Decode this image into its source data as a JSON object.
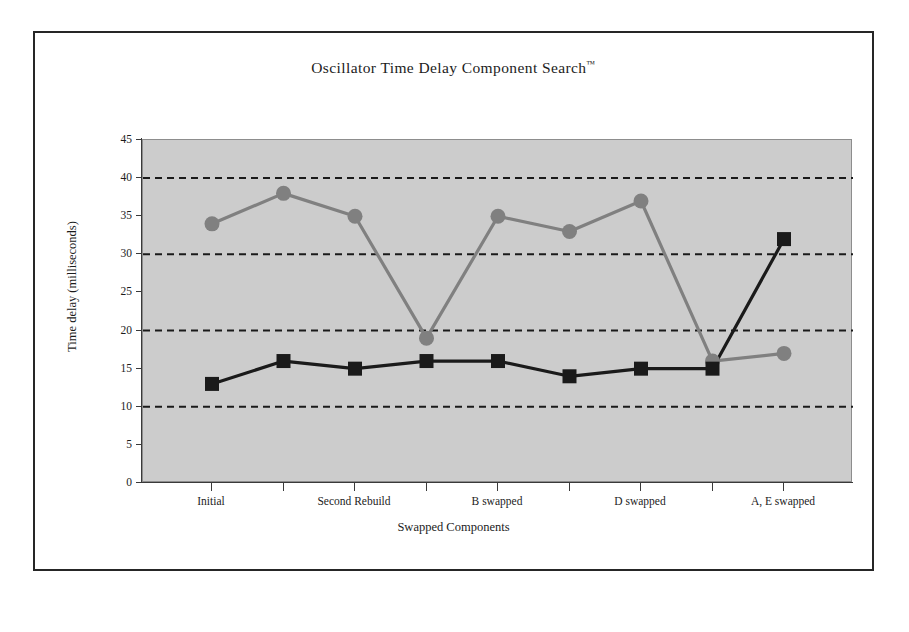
{
  "chart_data": {
    "type": "line",
    "title": "Oscillator Time Delay Component Search",
    "title_suffix": "™",
    "xlabel": "Swapped Components",
    "ylabel": "Time delay (milliseconds)",
    "ylim": [
      0,
      45
    ],
    "ytick_values": [
      0,
      5,
      10,
      15,
      20,
      25,
      30,
      35,
      40,
      45
    ],
    "ytick_labels": [
      "0",
      "5",
      "10",
      "15",
      "20",
      "25",
      "30",
      "35",
      "40",
      "45"
    ],
    "gridlines": [
      10,
      20,
      30,
      40
    ],
    "grid": "horizontal-dashed",
    "legend": "none",
    "x_count": 9,
    "xtick_labels": [
      "Initial",
      "",
      "Second Rebuild",
      "",
      "B swapped",
      "",
      "D swapped",
      "",
      "A, E swapped"
    ],
    "categories": [
      "Initial",
      "",
      "Second Rebuild",
      "",
      "B swapped",
      "",
      "D swapped",
      "",
      "A, E swapped"
    ],
    "series": [
      {
        "name": "gray-circle-series",
        "marker": "circle",
        "color": "#808080",
        "values": [
          34,
          38,
          35,
          19,
          35,
          33,
          37,
          16,
          17
        ]
      },
      {
        "name": "black-square-series",
        "marker": "square",
        "color": "#1a1a1a",
        "values": [
          13,
          16,
          15,
          16,
          16,
          14,
          15,
          15,
          32
        ]
      }
    ],
    "colors": {
      "plot_background": "#cccccc",
      "frame_background": "#ffffff",
      "frame_border": "#262626",
      "axis": "#3a3a3a",
      "series_gray": "#808080",
      "series_black": "#1a1a1a"
    }
  }
}
